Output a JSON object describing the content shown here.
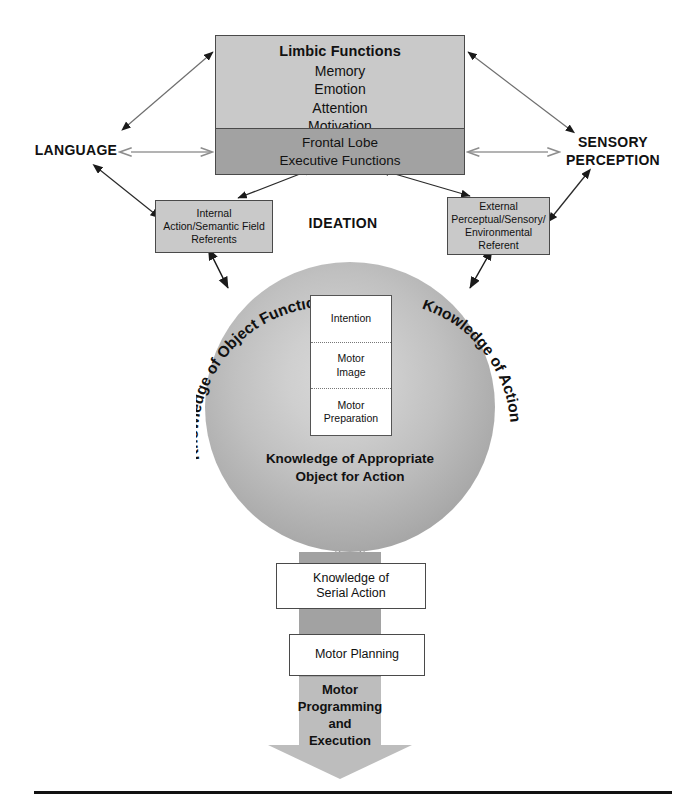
{
  "diagram": {
    "ideation_label": "IDEATION"
  },
  "colors": {
    "light_gray": "#c9c9c9",
    "dark_gray": "#a2a2a2",
    "arrow_light": "#bdbdbd",
    "border": "#4a4a4a",
    "text": "#111111",
    "sphere_edge": "#919191",
    "sphere_center": "#d8d8d8"
  },
  "limbic": {
    "title": "Limbic Functions",
    "items": [
      "Memory",
      "Emotion",
      "Attention",
      "Motivation"
    ],
    "frontal_line1": "Frontal Lobe",
    "frontal_line2": "Executive Functions"
  },
  "side_labels": {
    "left": "LANGUAGE",
    "right_line1": "SENSORY",
    "right_line2": "PERCEPTION"
  },
  "referents": {
    "internal": [
      "Internal",
      "Action/Semantic Field",
      "Referents"
    ],
    "external": [
      "External",
      "Perceptual/Sensory/",
      "Environmental",
      "Referent"
    ]
  },
  "sphere": {
    "arc_left": "Knowledge of Object Function",
    "arc_right": "Knowledge of Action",
    "bottom_line1": "Knowledge of Appropriate",
    "bottom_line2": "Object for Action",
    "inner_cells": [
      {
        "lines": [
          "Intention"
        ]
      },
      {
        "lines": [
          "Motor",
          "Image"
        ]
      },
      {
        "lines": [
          "Motor",
          "Preparation"
        ]
      }
    ]
  },
  "output_chain": {
    "serial_line1": "Knowledge of",
    "serial_line2": "Serial Action",
    "planning": "Motor Planning",
    "execution_lines": [
      "Motor",
      "Programming",
      "and",
      "Execution"
    ]
  },
  "caption": {
    "rule_visible": true,
    "text": ""
  }
}
